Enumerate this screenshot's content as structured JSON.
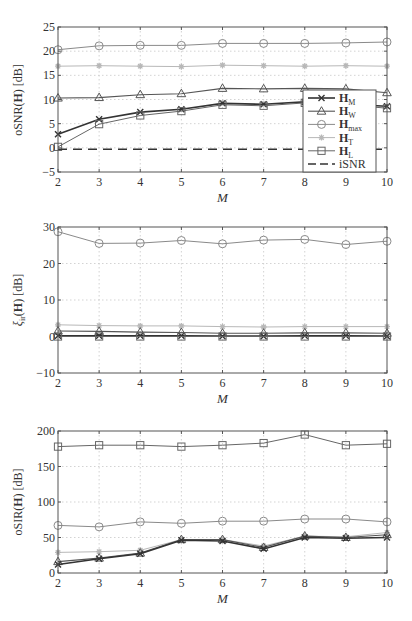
{
  "chart_data": [
    {
      "type": "line",
      "title": "",
      "xlabel": "M",
      "ylabel": "oSNR(H) [dB]",
      "x": [
        2,
        3,
        4,
        5,
        6,
        7,
        8,
        9,
        10
      ],
      "xlim": [
        2,
        10
      ],
      "ylim": [
        -5,
        25
      ],
      "yticks": [
        -5,
        0,
        5,
        10,
        15,
        20,
        25
      ],
      "xticks": [
        2,
        3,
        4,
        5,
        6,
        7,
        8,
        9,
        10
      ],
      "grid": true,
      "legend_position": "lower right",
      "series": [
        {
          "name": "H_M",
          "label_main": "H",
          "label_sub": "M",
          "marker": "x",
          "color": "#333333",
          "width": 1.6,
          "values": [
            2.8,
            5.9,
            7.4,
            8.0,
            9.2,
            9.0,
            9.5,
            9.0,
            8.6
          ]
        },
        {
          "name": "H_W",
          "label_main": "H",
          "label_sub": "W",
          "marker": "triangle",
          "color": "#555555",
          "width": 1.1,
          "values": [
            10.3,
            10.4,
            11.0,
            11.2,
            12.3,
            12.2,
            12.3,
            12.2,
            11.4
          ]
        },
        {
          "name": "H_max",
          "label_main": "H",
          "label_sub": "max",
          "marker": "circle",
          "color": "#8a8a8a",
          "width": 1.0,
          "values": [
            20.3,
            21.1,
            21.2,
            21.2,
            21.6,
            21.6,
            21.6,
            21.7,
            21.9
          ]
        },
        {
          "name": "H_T",
          "label_main": "H",
          "label_sub": "T",
          "marker": "star",
          "color": "#b8b8b8",
          "width": 1.0,
          "values": [
            16.9,
            17.0,
            16.9,
            16.8,
            17.1,
            17.0,
            16.9,
            17.0,
            16.9
          ]
        },
        {
          "name": "H_L",
          "label_main": "H",
          "label_sub": "L",
          "marker": "square",
          "color": "#666666",
          "width": 1.0,
          "values": [
            0.2,
            4.9,
            6.7,
            7.6,
            8.9,
            8.7,
            9.3,
            8.9,
            8.2
          ]
        },
        {
          "name": "iSNR",
          "label_main": "iSNR",
          "label_sub": "",
          "marker": "none",
          "dash": true,
          "color": "#333333",
          "width": 1.4,
          "values": [
            -0.3,
            -0.3,
            -0.3,
            -0.3,
            -0.3,
            -0.3,
            -0.3,
            -0.3,
            -0.3
          ]
        }
      ]
    },
    {
      "type": "line",
      "title": "",
      "xlabel": "M",
      "ylabel": "ξir(H) [dB]",
      "x": [
        2,
        3,
        4,
        5,
        6,
        7,
        8,
        9,
        10
      ],
      "xlim": [
        2,
        10
      ],
      "ylim": [
        -10,
        30
      ],
      "yticks": [
        -10,
        0,
        10,
        20,
        30
      ],
      "xticks": [
        2,
        3,
        4,
        5,
        6,
        7,
        8,
        9,
        10
      ],
      "grid": true,
      "series": [
        {
          "name": "H_max",
          "marker": "circle",
          "color": "#8a8a8a",
          "width": 1.0,
          "values": [
            28.7,
            25.5,
            25.6,
            26.3,
            25.4,
            26.4,
            26.6,
            25.2,
            26.1
          ]
        },
        {
          "name": "H_T",
          "marker": "star",
          "color": "#b8b8b8",
          "width": 1.0,
          "values": [
            3.2,
            3.0,
            2.9,
            2.9,
            2.7,
            2.6,
            2.7,
            2.7,
            2.7
          ]
        },
        {
          "name": "H_W",
          "marker": "triangle",
          "color": "#555555",
          "width": 1.1,
          "values": [
            1.5,
            1.4,
            1.2,
            1.1,
            0.9,
            0.9,
            1.0,
            1.0,
            0.9
          ]
        },
        {
          "name": "H_M",
          "marker": "x",
          "color": "#333333",
          "width": 1.6,
          "values": [
            0.2,
            0.2,
            0.2,
            0.2,
            0.1,
            0.1,
            0.2,
            0.2,
            0.1
          ]
        },
        {
          "name": "H_L",
          "marker": "square",
          "color": "#666666",
          "width": 1.0,
          "values": [
            0.0,
            0.0,
            0.0,
            0.0,
            0.0,
            0.0,
            0.0,
            0.0,
            0.0
          ]
        }
      ]
    },
    {
      "type": "line",
      "title": "",
      "xlabel": "M",
      "ylabel": "oSIR(H) [dB]",
      "x": [
        2,
        3,
        4,
        5,
        6,
        7,
        8,
        9,
        10
      ],
      "xlim": [
        2,
        10
      ],
      "ylim": [
        0,
        200
      ],
      "yticks": [
        0,
        50,
        100,
        150,
        200
      ],
      "xticks": [
        2,
        3,
        4,
        5,
        6,
        7,
        8,
        9,
        10
      ],
      "grid": true,
      "series": [
        {
          "name": "H_L",
          "marker": "square",
          "color": "#666666",
          "width": 1.0,
          "values": [
            178,
            180,
            180,
            178,
            180,
            183,
            195,
            180,
            182
          ]
        },
        {
          "name": "H_max",
          "marker": "circle",
          "color": "#8a8a8a",
          "width": 1.0,
          "values": [
            67,
            65,
            72,
            70,
            73,
            73,
            76,
            76,
            72
          ]
        },
        {
          "name": "H_T",
          "marker": "star",
          "color": "#b8b8b8",
          "width": 1.0,
          "values": [
            29,
            30,
            32,
            47,
            47,
            38,
            52,
            51,
            57
          ]
        },
        {
          "name": "H_W",
          "marker": "triangle",
          "color": "#555555",
          "width": 1.1,
          "values": [
            16,
            21,
            28,
            47,
            47,
            36,
            52,
            50,
            54
          ]
        },
        {
          "name": "H_M",
          "marker": "x",
          "color": "#333333",
          "width": 1.6,
          "values": [
            12,
            20,
            27,
            46,
            45,
            34,
            50,
            49,
            50
          ]
        }
      ]
    }
  ],
  "panels": [
    {
      "ylabel_main": "oSNR",
      "ylabel_arg": "(H)",
      "ylabel_unit": " [dB]",
      "xlabel": "M"
    },
    {
      "ylabel_main": "ξ",
      "ylabel_sub": "ir",
      "ylabel_arg": "(H)",
      "ylabel_unit": " [dB]",
      "xlabel": "M"
    },
    {
      "ylabel_main": "oSIR",
      "ylabel_arg": "(H)",
      "ylabel_unit": " [dB]",
      "xlabel": "M"
    }
  ]
}
